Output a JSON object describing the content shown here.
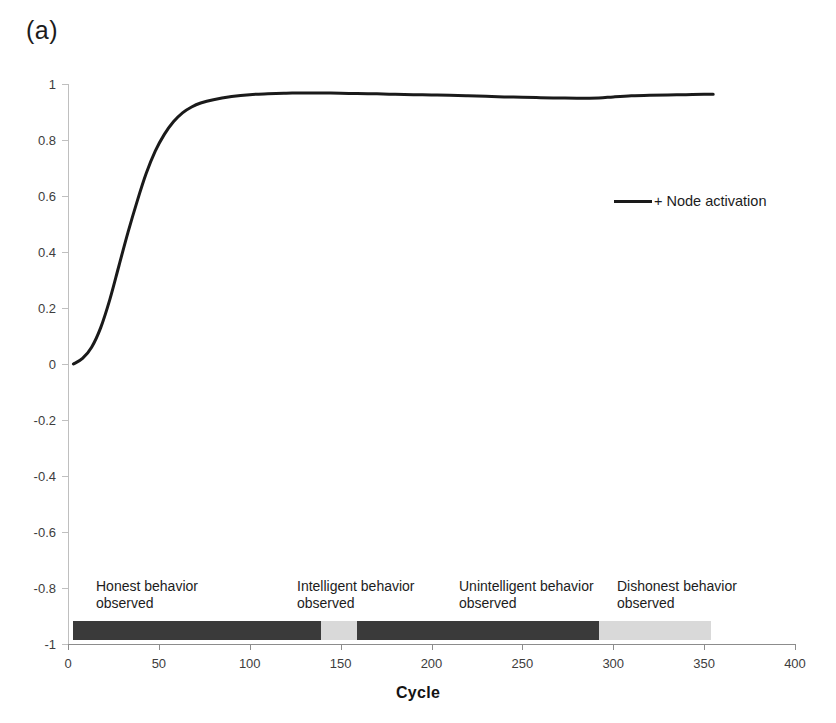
{
  "panel": {
    "label": "(a)"
  },
  "legend": {
    "position": "inside-upper-right",
    "entries": [
      {
        "label": "+ Node activation",
        "color": "#1a1a1a",
        "marker": "line"
      }
    ]
  },
  "axes": {
    "x": {
      "title": "Cycle",
      "ticks": [
        0,
        50,
        100,
        150,
        200,
        250,
        300,
        350,
        400
      ],
      "tick_labels": [
        "0",
        "50",
        "100",
        "150",
        "200",
        "250",
        "300",
        "350",
        "400"
      ],
      "range": [
        0,
        400
      ]
    },
    "y": {
      "title": "",
      "ticks": [
        1,
        0.8,
        0.6,
        0.4,
        0.2,
        0,
        -0.2,
        -0.4,
        -0.6,
        -0.8,
        -1
      ],
      "tick_labels": [
        "1",
        "0.8",
        "0.6",
        "0.4",
        "0.2",
        "0",
        "-0.2",
        "-0.4",
        "-0.6",
        "-0.8",
        "-1"
      ],
      "range": [
        -1,
        1
      ]
    }
  },
  "phases": [
    {
      "caption_line1": "Honest behavior",
      "caption_line2": "observed",
      "start_cycle": 3,
      "end_cycle": 139,
      "color": "#3a3a3a",
      "caption_left_px": 96,
      "caption_top_px": 578
    },
    {
      "caption_line1": "Intelligent behavior",
      "caption_line2": "observed",
      "start_cycle": 139,
      "end_cycle": 159,
      "color": "#d9d9d9",
      "caption_left_px": 297,
      "caption_top_px": 578
    },
    {
      "caption_line1": "Unintelligent behavior",
      "caption_line2": "observed",
      "start_cycle": 159,
      "end_cycle": 292,
      "color": "#3a3a3a",
      "caption_left_px": 459,
      "caption_top_px": 578
    },
    {
      "caption_line1": "Dishonest behavior",
      "caption_line2": "observed",
      "start_cycle": 292,
      "end_cycle": 354,
      "color": "#d9d9d9",
      "caption_left_px": 617,
      "caption_top_px": 578
    }
  ],
  "chart_data": {
    "type": "line",
    "title": "",
    "xlabel": "Cycle",
    "ylabel": "",
    "xlim": [
      0,
      400
    ],
    "ylim": [
      -1,
      1
    ],
    "grid": false,
    "legend_position": "inside-upper-right",
    "series": [
      {
        "name": "+ Node activation",
        "color": "#1a1a1a",
        "x": [
          3,
          8,
          13,
          18,
          23,
          28,
          33,
          38,
          43,
          48,
          53,
          58,
          63,
          68,
          73,
          80,
          90,
          100,
          110,
          120,
          130,
          139,
          150,
          159,
          170,
          180,
          190,
          200,
          210,
          220,
          230,
          240,
          250,
          260,
          270,
          280,
          292,
          300,
          310,
          320,
          330,
          340,
          350,
          355
        ],
        "y": [
          0.0,
          0.02,
          0.06,
          0.13,
          0.23,
          0.35,
          0.47,
          0.58,
          0.68,
          0.76,
          0.82,
          0.865,
          0.897,
          0.918,
          0.932,
          0.944,
          0.955,
          0.962,
          0.965,
          0.967,
          0.968,
          0.968,
          0.967,
          0.966,
          0.965,
          0.963,
          0.962,
          0.961,
          0.96,
          0.958,
          0.956,
          0.954,
          0.953,
          0.951,
          0.95,
          0.949,
          0.95,
          0.954,
          0.958,
          0.96,
          0.961,
          0.962,
          0.963,
          0.963
        ]
      }
    ],
    "annotations": [
      {
        "text": "Honest behavior observed",
        "span_cycles": [
          3,
          139
        ],
        "band_color": "#3a3a3a",
        "band_value": -0.95
      },
      {
        "text": "Intelligent behavior observed",
        "span_cycles": [
          139,
          159
        ],
        "band_color": "#d9d9d9",
        "band_value": -0.95
      },
      {
        "text": "Unintelligent behavior observed",
        "span_cycles": [
          159,
          292
        ],
        "band_color": "#3a3a3a",
        "band_value": -0.95
      },
      {
        "text": "Dishonest behavior observed",
        "span_cycles": [
          292,
          354
        ],
        "band_color": "#d9d9d9",
        "band_value": -0.95
      }
    ]
  }
}
